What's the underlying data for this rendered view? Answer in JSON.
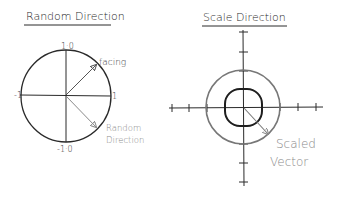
{
  "left_panel": {
    "title": "Random Direction",
    "labels": {
      "top": "1·0",
      "bottom": "-1·0",
      "left": "-1",
      "right": "1"
    },
    "facing_label": "facing",
    "random_label_line1": "Random",
    "random_label_line2": "Direction"
  },
  "right_panel": {
    "title": "Scale Direction",
    "scaled_label_line1": "Scaled",
    "scaled_label_line2": "Vector"
  },
  "colors": {
    "ink": "#2a2a2a",
    "gray": "#8a8a8a"
  }
}
